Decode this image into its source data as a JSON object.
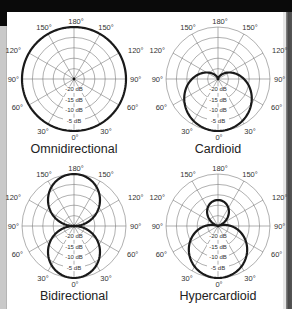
{
  "figure": {
    "colors": {
      "pattern_stroke": "#1a1a1a",
      "grid_stroke": "#7a7a7a",
      "background": "#ffffff"
    },
    "angle_labels": {
      "top": "180°",
      "upper_left": "150°",
      "upper_right": "150°",
      "mid_upper_left": "120°",
      "mid_upper_right": "120°",
      "left": "90°",
      "right": "90°",
      "lower_left": "60°",
      "lower_right": "60°",
      "bottom_left": "30°",
      "bottom_right": "30°",
      "bottom": "0°"
    },
    "db_labels": [
      "-20 dB",
      "-15 dB",
      "-10 dB",
      "-5 dB"
    ],
    "diagrams": [
      {
        "id": "omnidirectional",
        "title": "Omnidirectional",
        "pattern": "omni"
      },
      {
        "id": "cardioid",
        "title": "Cardioid",
        "pattern": "cardioid"
      },
      {
        "id": "bidirectional",
        "title": "Bidirectional",
        "pattern": "figure-8"
      },
      {
        "id": "hypercardioid",
        "title": "Hypercardioid",
        "pattern": "hypercardioid"
      }
    ]
  }
}
